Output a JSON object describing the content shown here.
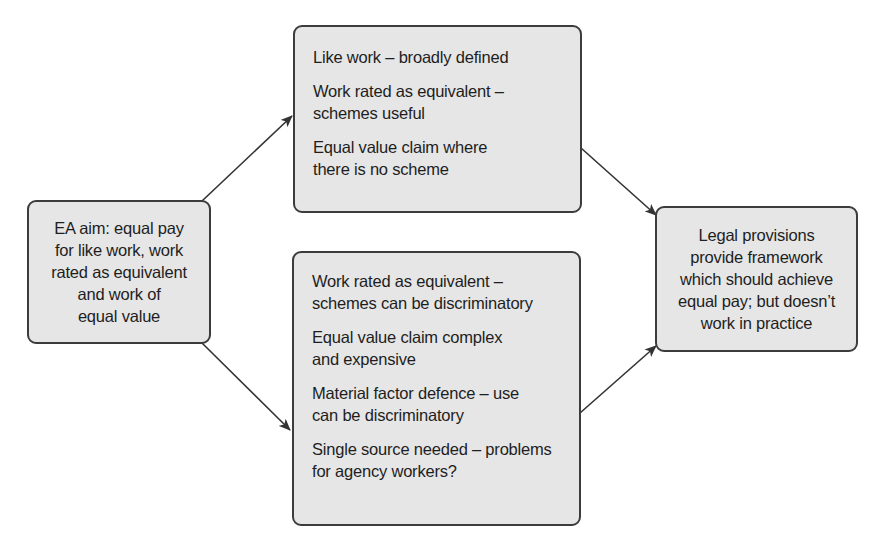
{
  "diagram": {
    "type": "flow",
    "nodes": [
      {
        "id": "ea_aim",
        "lines": [
          "EA aim: equal pay",
          "for like work, work",
          "rated as equivalent",
          "and work of",
          "equal value"
        ]
      },
      {
        "id": "strengths",
        "items": [
          "Like work – broadly defined",
          "Work rated as equivalent – schemes useful",
          "Equal value claim where there is no scheme"
        ]
      },
      {
        "id": "weaknesses",
        "items": [
          "Work rated as equivalent – schemes can be discriminatory",
          "Equal value claim complex and expensive",
          "Material factor defence – use can be discriminatory",
          "Single source needed – problems for agency workers?"
        ]
      },
      {
        "id": "conclusion",
        "lines": [
          "Legal provisions",
          "provide framework",
          "which should achieve",
          "equal pay; but doesn’t",
          "work in practice"
        ]
      }
    ],
    "edges": [
      {
        "from": "ea_aim",
        "to": "strengths"
      },
      {
        "from": "ea_aim",
        "to": "weaknesses"
      },
      {
        "from": "strengths",
        "to": "conclusion"
      },
      {
        "from": "weaknesses",
        "to": "conclusion"
      }
    ],
    "colors": {
      "box_fill": "#e6e6e6",
      "box_border": "#3c3c3c",
      "arrow": "#333333",
      "text": "#1e1e1e"
    }
  }
}
